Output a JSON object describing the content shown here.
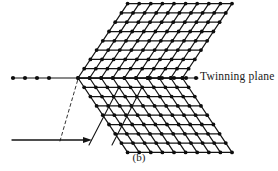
{
  "figure": {
    "caption": "(b)",
    "twinning_plane_label": "Twinning plane",
    "colors": {
      "ink": "#141414",
      "node": "#0d0d0d",
      "background": "#ffffff",
      "dashed_guide": "#333333"
    }
  },
  "geometry": {
    "twinning_plane": {
      "y": 78,
      "x_start": 12,
      "x_end": 198,
      "left_dot_xs": [
        13,
        25,
        37,
        49
      ],
      "right_dot_xs": [
        150,
        162,
        174,
        186,
        196
      ]
    },
    "lattice": {
      "rows_upper": 8,
      "rows_lower": 8,
      "columns": 9,
      "cell_width": 11.6,
      "cell_height": 9.3,
      "apex_x": 78,
      "shear_per_row": 6.2,
      "node_radius": 1.9
    },
    "shear_arrow": {
      "x_start": 12,
      "x_end": 92,
      "y": 140,
      "head_length": 9,
      "head_width": 6
    },
    "dashed_guide": {
      "x_start": 60,
      "y_start": 141,
      "x_end": 78,
      "y_end": 79,
      "dash": "3 3"
    },
    "twin_band_lines": [
      {
        "x1": 141,
        "y1": 89,
        "x2": 112,
        "y2": 145
      },
      {
        "x1": 118,
        "y1": 89,
        "x2": 89,
        "y2": 145
      }
    ]
  }
}
